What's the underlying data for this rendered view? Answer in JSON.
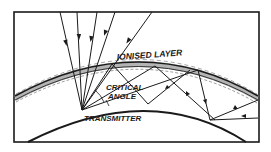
{
  "diagram": {
    "type": "radio-wave-propagation",
    "labels": {
      "ionised_layer": "IONISED LAYER",
      "critical": "CRITICAL",
      "angle": "ANGLE",
      "transmitter": "TRANSMITTER"
    },
    "colors": {
      "ink": "#1a1a1a",
      "background": "#ffffff",
      "layer_shade": "#555555"
    }
  }
}
